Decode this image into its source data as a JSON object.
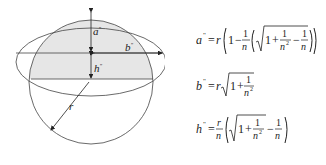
{
  "diagram": {
    "labels": {
      "a": "a",
      "a_sup": "\"",
      "b": "b",
      "b_sup": "\"",
      "h": "h",
      "h_sup": "\"",
      "r": "r"
    },
    "colors": {
      "stroke": "#444444",
      "fill_shaded": "#e6e6e6",
      "background": "#ffffff"
    }
  },
  "formulas": [
    {
      "id": "a-formula",
      "lhs": "a",
      "sup": "\"",
      "text": "= r(1 − (1/n)(√(1 + 1/n²) − 1/n))"
    },
    {
      "id": "b-formula",
      "lhs": "b",
      "sup": "\"",
      "text": "= r√(1 + 1/n²)"
    },
    {
      "id": "h-formula",
      "lhs": "h",
      "sup": "\"",
      "text": "= (r/n)(√(1 + 1/n²) − 1/n)"
    }
  ],
  "formula_parts": {
    "eq": "=",
    "r": "r",
    "one": "1",
    "n": "n",
    "n2": "n",
    "two": "2",
    "plus": "+",
    "minus": "−"
  }
}
